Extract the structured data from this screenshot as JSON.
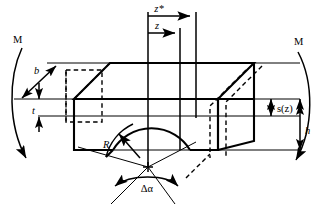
{
  "figure": {
    "colors": {
      "ink": "#000000",
      "background": "#ffffff"
    },
    "labels": {
      "moment_left": "M",
      "moment_right": "M",
      "axis_z_star": "z*",
      "axis_z": "z",
      "width_b": "b",
      "thickness_t": "t",
      "radius_R": "R",
      "angle_delta_alpha": "Δα",
      "section_s_z": "s(z)",
      "height_h": "h"
    },
    "icons": {
      "moment_arc_left": "curved-moment-arrow-icon",
      "moment_arc_right": "curved-moment-arrow-icon",
      "arrow_z_star": "right-arrow-icon",
      "arrow_z": "right-arrow-icon",
      "arrow_b": "double-arrow-diagonal-icon",
      "arrow_t": "double-arrow-vertical-icon",
      "arrow_R": "leader-arrow-icon",
      "arrow_delta_alpha": "double-arc-arrow-icon",
      "arrow_s_z": "double-arrow-vertical-icon",
      "arrow_h": "double-arrow-vertical-icon",
      "center_mark": "cross-mark-icon"
    }
  }
}
